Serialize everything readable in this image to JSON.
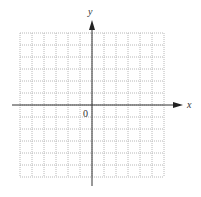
{
  "diagram": {
    "type": "coordinate-plane",
    "x_axis_label": "x",
    "y_axis_label": "y",
    "origin_label": "0",
    "grid": {
      "columns": 12,
      "rows": 12,
      "style": "dotted",
      "color": "#b8b8b8"
    },
    "axis_color": "#333333",
    "background": "#ffffff"
  }
}
